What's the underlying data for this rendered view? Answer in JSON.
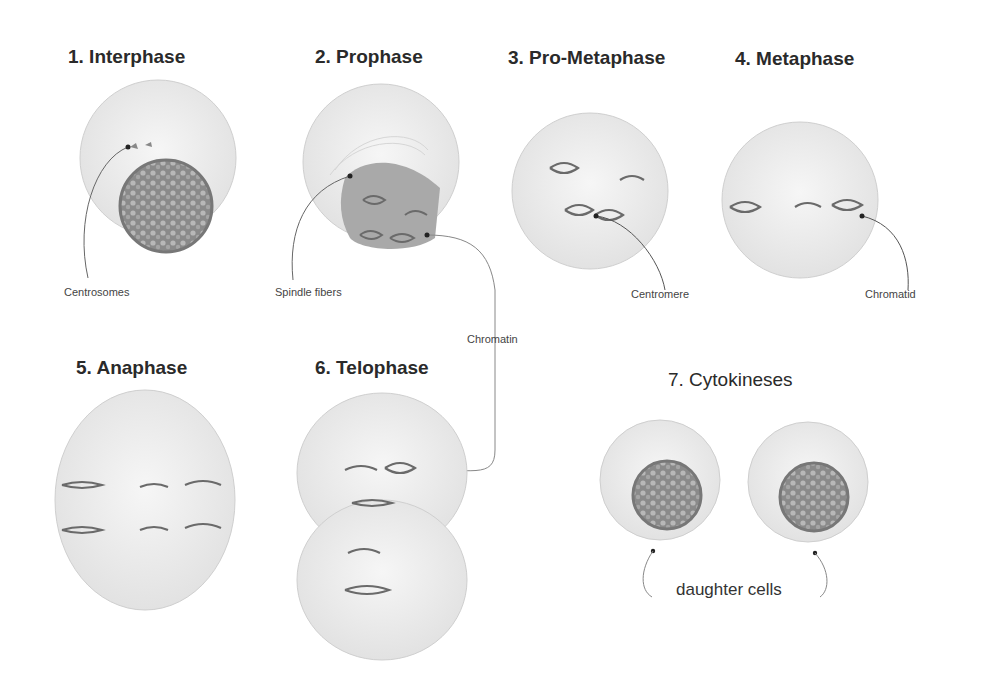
{
  "diagram": {
    "stages": [
      {
        "number": 1,
        "title": "1. Interphase"
      },
      {
        "number": 2,
        "title": "2. Prophase"
      },
      {
        "number": 3,
        "title": "3. Pro-Metaphase"
      },
      {
        "number": 4,
        "title": "4. Metaphase"
      },
      {
        "number": 5,
        "title": "5. Anaphase"
      },
      {
        "number": 6,
        "title": "6. Telophase"
      },
      {
        "number": 7,
        "title": "7. Cytokineses"
      }
    ],
    "annotations": {
      "centrosomes": "Centrosomes",
      "spindle_fibers": "Spindle fibers",
      "centromere": "Centromere",
      "chromatid": "Chromatid",
      "chromatin": "Chromatin",
      "daughter_cells": "daughter cells"
    },
    "colors": {
      "background": "#ffffff",
      "cell_fill": "#ececec",
      "cell_outline": "#c8c8c8",
      "nucleus": "#7a7a7a",
      "chromosome": "#6a6a6a",
      "pointer": "#555555"
    }
  }
}
